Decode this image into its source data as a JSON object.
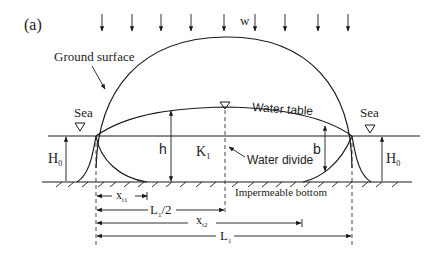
{
  "figure": {
    "panel_label": "(a)",
    "recharge_label": "w",
    "ground_surface_label": "Ground surface",
    "water_table_label": "Water table",
    "water_divide_label": "Water divide",
    "impermeable_bottom_label": "Impermeable bottom",
    "sea_left_label": "Sea",
    "sea_right_label": "Sea",
    "h_label": "h",
    "k_label": "K",
    "k_sub": "1",
    "b_label": "b",
    "H0_left_label": "H",
    "H0_left_sub": "0",
    "H0_right_label": "H",
    "H0_right_sub": "0",
    "dimensions": {
      "xt1": {
        "label": "x",
        "sub": "t1"
      },
      "half_L": {
        "label": "L",
        "sub": "1",
        "suffix": "/2"
      },
      "xt2": {
        "label": "x",
        "sub": "t2"
      },
      "L": {
        "label": "L",
        "sub": "1"
      }
    }
  }
}
